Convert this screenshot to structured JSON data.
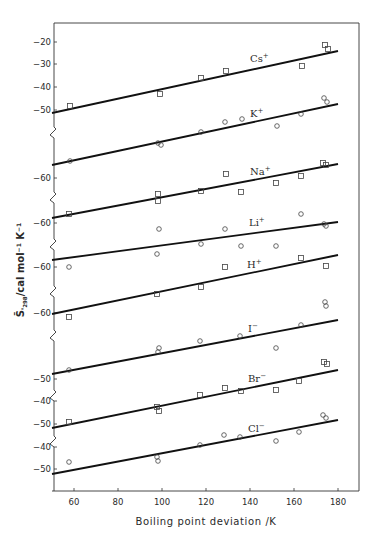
{
  "chart_data": {
    "type": "scatter",
    "title": "",
    "xlabel": "Boiling point deviation /K",
    "ylabel": "S̄°298 /cal mol⁻¹ K⁻¹",
    "xlim": [
      50,
      190
    ],
    "x_ticks": [
      60,
      80,
      100,
      120,
      140,
      160,
      180
    ],
    "grid": false,
    "legend": "inline labels on each fitted line",
    "series": [
      {
        "name": "Cs+",
        "label_main": "Cs",
        "label_sup": "+",
        "marker": "square",
        "y_ticks": [
          -20,
          -30,
          -40,
          -50
        ],
        "fit": {
          "x": [
            50,
            180
          ],
          "y": [
            -51,
            -24
          ]
        },
        "points": [
          {
            "x": 57,
            "y": -48
          },
          {
            "x": 98,
            "y": -43
          },
          {
            "x": 117,
            "y": -36
          },
          {
            "x": 128,
            "y": -33
          },
          {
            "x": 163,
            "y": -31
          },
          {
            "x": 174,
            "y": -21
          },
          {
            "x": 175,
            "y": -23
          }
        ]
      },
      {
        "name": "K+",
        "label_main": "K",
        "label_sup": "+",
        "marker": "circle",
        "y_ticks": [],
        "fit": {
          "x": [
            50,
            180
          ],
          "y": [
            -78,
            -51
          ]
        },
        "points": [
          {
            "x": 57,
            "y": -76
          },
          {
            "x": 97,
            "y": -68
          },
          {
            "x": 98,
            "y": -69
          },
          {
            "x": 117,
            "y": -64
          },
          {
            "x": 128,
            "y": -61
          },
          {
            "x": 135,
            "y": -60
          },
          {
            "x": 151,
            "y": -63
          },
          {
            "x": 162,
            "y": -58
          },
          {
            "x": 174,
            "y": -53
          },
          {
            "x": 175,
            "y": -55
          }
        ]
      },
      {
        "name": "Na+",
        "label_main": "Na",
        "label_sup": "+",
        "marker": "square",
        "y_ticks": [
          -60
        ],
        "fit": {
          "x": [
            50,
            180
          ],
          "y": [
            -75,
            -57
          ]
        },
        "points": [
          {
            "x": 57,
            "y": -74
          },
          {
            "x": 97,
            "y": -68
          },
          {
            "x": 97,
            "y": -69
          },
          {
            "x": 117,
            "y": -67
          },
          {
            "x": 128,
            "y": -63
          },
          {
            "x": 135,
            "y": -68
          },
          {
            "x": 151,
            "y": -65
          },
          {
            "x": 162,
            "y": -62
          },
          {
            "x": 173,
            "y": -57
          },
          {
            "x": 175,
            "y": -57
          }
        ]
      },
      {
        "name": "Li+",
        "label_main": "Li",
        "label_sup": "+",
        "marker": "circle",
        "y_ticks": [
          -60
        ],
        "fit": {
          "x": [
            50,
            180
          ],
          "y": [
            -71,
            -61
          ]
        },
        "points": [
          {
            "x": 57,
            "y": -79
          },
          {
            "x": 98,
            "y": -63
          },
          {
            "x": 117,
            "y": -67
          },
          {
            "x": 128,
            "y": -63
          },
          {
            "x": 135,
            "y": -68
          },
          {
            "x": 151,
            "y": -68
          },
          {
            "x": 162,
            "y": -60
          },
          {
            "x": 174,
            "y": -61
          },
          {
            "x": 175,
            "y": -62
          }
        ]
      },
      {
        "name": "H+",
        "label_main": "H",
        "label_sup": "+",
        "marker": "square",
        "y_ticks": [
          -60
        ],
        "fit": {
          "x": [
            50,
            180
          ],
          "y": [
            -72,
            -54
          ]
        },
        "points": [
          {
            "x": 57,
            "y": -75
          },
          {
            "x": 97,
            "y": -69
          },
          {
            "x": 117,
            "y": -67
          },
          {
            "x": 128,
            "y": -60
          },
          {
            "x": 162,
            "y": -58
          },
          {
            "x": 174,
            "y": -61
          }
        ]
      },
      {
        "name": "I-",
        "label_main": "I",
        "label_sup": "−",
        "marker": "circle",
        "y_ticks": [],
        "fit": {
          "x": [
            50,
            180
          ],
          "y": [
            -56,
            -38
          ]
        },
        "points": [
          {
            "x": 57,
            "y": -55
          },
          {
            "x": 97,
            "y": -49
          },
          {
            "x": 98,
            "y": -48
          },
          {
            "x": 117,
            "y": -47
          },
          {
            "x": 135,
            "y": -46
          },
          {
            "x": 151,
            "y": -50
          },
          {
            "x": 162,
            "y": -43
          },
          {
            "x": 173,
            "y": -37
          },
          {
            "x": 174,
            "y": -38
          }
        ]
      },
      {
        "name": "Br-",
        "label_main": "Br",
        "label_sup": "−",
        "marker": "square",
        "y_ticks": [
          -50,
          -40
        ],
        "fit": {
          "x": [
            50,
            180
          ],
          "y": [
            -52,
            -35
          ]
        },
        "points": [
          {
            "x": 57,
            "y": -49
          },
          {
            "x": 97,
            "y": -43
          },
          {
            "x": 98,
            "y": -44
          },
          {
            "x": 117,
            "y": -41
          },
          {
            "x": 128,
            "y": -39
          },
          {
            "x": 135,
            "y": -40
          },
          {
            "x": 151,
            "y": -40
          },
          {
            "x": 162,
            "y": -37
          },
          {
            "x": 173,
            "y": -33
          },
          {
            "x": 174,
            "y": -34
          }
        ]
      },
      {
        "name": "Cl-",
        "label_main": "Cl",
        "label_sup": "−",
        "marker": "circle",
        "y_ticks": [
          -50,
          -40,
          -50
        ],
        "fit": {
          "x": [
            50,
            180
          ],
          "y": [
            -52,
            -37
          ]
        },
        "points": [
          {
            "x": 57,
            "y": -47
          },
          {
            "x": 97,
            "y": -45
          },
          {
            "x": 98,
            "y": -46
          },
          {
            "x": 117,
            "y": -40
          },
          {
            "x": 128,
            "y": -36
          },
          {
            "x": 135,
            "y": -36
          },
          {
            "x": 151,
            "y": -38
          },
          {
            "x": 162,
            "y": -35
          },
          {
            "x": 173,
            "y": -32
          },
          {
            "x": 174,
            "y": -33
          }
        ]
      }
    ]
  },
  "render": {
    "frame": {
      "left": 54,
      "right": 359,
      "top": 23,
      "bottom": 491
    },
    "x_map": {
      "x0": 50,
      "px0": 52,
      "scale": 2.2
    },
    "x_tick_labels": [
      "60",
      "80",
      "100",
      "120",
      "140",
      "160",
      "180"
    ],
    "x_tick_px": [
      74,
      118,
      162,
      206,
      250,
      294,
      338
    ],
    "y_tick_labels": [
      {
        "text": "-20",
        "y": 42
      },
      {
        "text": "-30",
        "y": 64
      },
      {
        "text": "-40",
        "y": 87
      },
      {
        "text": "-50",
        "y": 110
      },
      {
        "text": "-60",
        "y": 178
      },
      {
        "text": "-60",
        "y": 223
      },
      {
        "text": "-60",
        "y": 267
      },
      {
        "text": "-60",
        "y": 313
      },
      {
        "text": "-50",
        "y": 379
      },
      {
        "text": "-40",
        "y": 401
      },
      {
        "text": "-50",
        "y": 424
      },
      {
        "text": "-40",
        "y": 447
      },
      {
        "text": "-50",
        "y": 469
      }
    ],
    "breaks_y": [
      133,
      198,
      245,
      292,
      336,
      396,
      442
    ],
    "lines": [
      {
        "name": "Cs+",
        "y1": 113,
        "y2": 51,
        "lx": 250,
        "ly": 62
      },
      {
        "name": "K+",
        "y1": 165,
        "y2": 104,
        "lx": 250,
        "ly": 117
      },
      {
        "name": "Na+",
        "y1": 218,
        "y2": 164,
        "lx": 250,
        "ly": 175
      },
      {
        "name": "Li+",
        "y1": 260,
        "y2": 222,
        "lx": 249,
        "ly": 226
      },
      {
        "name": "H+",
        "y1": 314,
        "y2": 255,
        "lx": 247,
        "ly": 268
      },
      {
        "name": "I-",
        "y1": 374,
        "y2": 320,
        "lx": 248,
        "ly": 332
      },
      {
        "name": "Br-",
        "y1": 428,
        "y2": 370,
        "lx": 248,
        "ly": 382
      },
      {
        "name": "Cl-",
        "y1": 474,
        "y2": 420,
        "lx": 248,
        "ly": 432
      }
    ],
    "point_px": [
      {
        "s": "square",
        "pts": [
          [
            70,
            106
          ],
          [
            160,
            94
          ],
          [
            201,
            78
          ],
          [
            226,
            71
          ],
          [
            302,
            66
          ],
          [
            325,
            45
          ],
          [
            328,
            49
          ]
        ]
      },
      {
        "s": "circle",
        "pts": [
          [
            70,
            161
          ],
          [
            158,
            143
          ],
          [
            161,
            145
          ],
          [
            201,
            132
          ],
          [
            225,
            122
          ],
          [
            242,
            119
          ],
          [
            277,
            126
          ],
          [
            301,
            114
          ],
          [
            324,
            98
          ],
          [
            327,
            102
          ]
        ]
      },
      {
        "s": "square",
        "pts": [
          [
            226,
            174
          ],
          [
            301,
            176
          ],
          [
            323,
            163
          ],
          [
            326,
            165
          ],
          [
            158,
            194
          ],
          [
            158,
            201
          ],
          [
            201,
            191
          ],
          [
            241,
            192
          ],
          [
            276,
            183
          ],
          [
            69,
            214
          ]
        ]
      },
      {
        "s": "circle",
        "pts": [
          [
            159,
            229
          ],
          [
            225,
            229
          ],
          [
            301,
            214
          ],
          [
            324,
            224
          ],
          [
            326,
            226
          ],
          [
            201,
            244
          ],
          [
            241,
            246
          ],
          [
            276,
            246
          ],
          [
            157,
            254
          ],
          [
            69,
            267
          ]
        ]
      },
      {
        "s": "square",
        "pts": [
          [
            225,
            267
          ],
          [
            301,
            258
          ],
          [
            326,
            266
          ],
          [
            201,
            287
          ],
          [
            157,
            294
          ],
          [
            69,
            317
          ]
        ]
      },
      {
        "s": "circle",
        "pts": [
          [
            325,
            302
          ],
          [
            326,
            306
          ],
          [
            159,
            348
          ],
          [
            158,
            352
          ],
          [
            200,
            341
          ],
          [
            240,
            336
          ],
          [
            301,
            325
          ],
          [
            276,
            348
          ],
          [
            69,
            370
          ]
        ]
      },
      {
        "s": "square",
        "pts": [
          [
            324,
            362
          ],
          [
            327,
            364
          ],
          [
            299,
            381
          ],
          [
            225,
            388
          ],
          [
            241,
            391
          ],
          [
            276,
            390
          ],
          [
            200,
            395
          ],
          [
            157,
            407
          ],
          [
            159,
            411
          ],
          [
            69,
            422
          ]
        ]
      },
      {
        "s": "circle",
        "pts": [
          [
            323,
            415
          ],
          [
            326,
            418
          ],
          [
            224,
            435
          ],
          [
            240,
            437
          ],
          [
            299,
            432
          ],
          [
            276,
            441
          ],
          [
            200,
            445
          ],
          [
            157,
            457
          ],
          [
            158,
            461
          ],
          [
            69,
            462
          ]
        ]
      }
    ]
  }
}
